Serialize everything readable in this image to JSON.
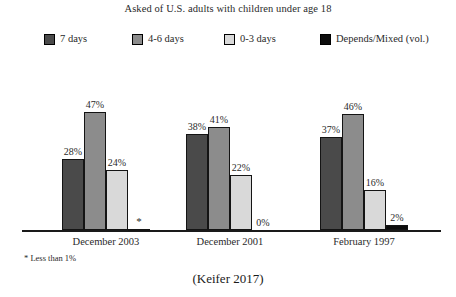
{
  "chart_data": {
    "type": "bar",
    "title": "Asked of U.S. adults with children under age 18",
    "xlabel": "",
    "ylabel": "",
    "ylim": [
      0,
      50
    ],
    "grid": false,
    "legend_position": "top",
    "categories": [
      "December 2003",
      "December 2001",
      "February 1997"
    ],
    "series": [
      {
        "name": "7 days",
        "color": "#4a4a4a",
        "values": [
          28,
          38,
          37
        ],
        "labels": [
          "28%",
          "38%",
          "37%"
        ]
      },
      {
        "name": "4-6 days",
        "color": "#8c8c8c",
        "values": [
          47,
          41,
          46
        ],
        "labels": [
          "47%",
          "41%",
          "46%"
        ]
      },
      {
        "name": "0-3 days",
        "color": "#d9d9d9",
        "values": [
          24,
          22,
          16
        ],
        "labels": [
          "24%",
          "22%",
          "16%"
        ]
      },
      {
        "name": "Depends/Mixed (vol.)",
        "color": "#0d0d0d",
        "values": [
          0.4,
          0,
          2
        ],
        "labels": [
          "*",
          "0%",
          "2%"
        ]
      }
    ],
    "footnote": "* Less than 1%",
    "citation": "(Keifer 2017)"
  },
  "legend": {
    "items": [
      {
        "label": "7 days"
      },
      {
        "label": "4-6 days"
      },
      {
        "label": "0-3 days"
      },
      {
        "label": "Depends/Mixed (vol.)"
      }
    ]
  }
}
